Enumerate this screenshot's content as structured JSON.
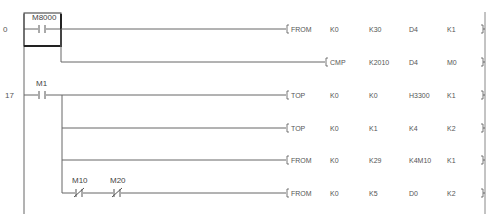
{
  "diagram": {
    "type": "ladder",
    "rungs": [
      {
        "step": "0",
        "contacts": [
          {
            "device": "M8000",
            "kind": "NO"
          }
        ],
        "outputs": [
          {
            "instruction": "FROM",
            "operands": [
              "K0",
              "K30",
              "D4",
              "K1"
            ]
          },
          {
            "instruction": "CMP",
            "operands": [
              "K2010",
              "D4",
              "M0"
            ]
          }
        ]
      },
      {
        "step": "17",
        "contacts": [
          {
            "device": "M1",
            "kind": "NO"
          }
        ],
        "outputs": [
          {
            "instruction": "TOP",
            "operands": [
              "K0",
              "K0",
              "H3300",
              "K1"
            ]
          },
          {
            "instruction": "TOP",
            "operands": [
              "K0",
              "K1",
              "K4",
              "K2"
            ]
          },
          {
            "instruction": "FROM",
            "operands": [
              "K0",
              "K29",
              "K4M10",
              "K1"
            ]
          },
          {
            "instruction": "FROM",
            "operands": [
              "K0",
              "K5",
              "D0",
              "K2"
            ],
            "series_contacts": [
              {
                "device": "M10",
                "kind": "NC"
              },
              {
                "device": "M20",
                "kind": "NC"
              }
            ]
          }
        ]
      }
    ],
    "cursor_on": "M8000"
  }
}
